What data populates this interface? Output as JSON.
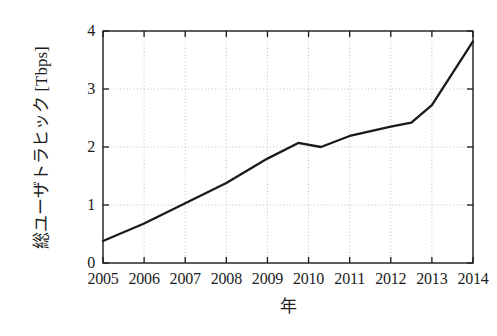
{
  "chart_data": {
    "type": "line",
    "title": "",
    "subtitle": "",
    "xlabel": "年",
    "ylabel": "総ユーザトラヒック [Tbps]",
    "ylabel_parts": {
      "name": "総ユーザトラヒック",
      "unit": "[Tbps]"
    },
    "xlim": [
      2005,
      2014
    ],
    "ylim": [
      0,
      4
    ],
    "grid": "dotted-both",
    "legend": "none",
    "line_color": "#1a1a1a",
    "grid_color": "#bfbfbf",
    "axis_color": "#1a1a1a",
    "background_color": "#ffffff",
    "xticks": [
      2005,
      2006,
      2007,
      2008,
      2009,
      2010,
      2011,
      2012,
      2013,
      2014
    ],
    "xtick_labels": [
      "2005",
      "2006",
      "2007",
      "2008",
      "2009",
      "2010",
      "2011",
      "2012",
      "2013",
      "2014"
    ],
    "yticks": [
      0,
      1,
      2,
      3,
      4
    ],
    "ytick_labels": [
      "0",
      "1",
      "2",
      "3",
      "4"
    ],
    "series": [
      {
        "name": "総ユーザトラヒック",
        "x": [
          2005.0,
          2006.0,
          2007.0,
          2008.0,
          2009.0,
          2009.75,
          2010.3,
          2011.0,
          2012.0,
          2012.5,
          2013.0,
          2014.0
        ],
        "values": [
          0.38,
          0.68,
          1.03,
          1.38,
          1.8,
          2.07,
          2.0,
          2.19,
          2.35,
          2.42,
          2.72,
          3.82
        ]
      }
    ],
    "annotations": []
  },
  "figure": {
    "plot_left": 103,
    "plot_right": 473,
    "plot_top": 31,
    "plot_bottom": 263
  }
}
